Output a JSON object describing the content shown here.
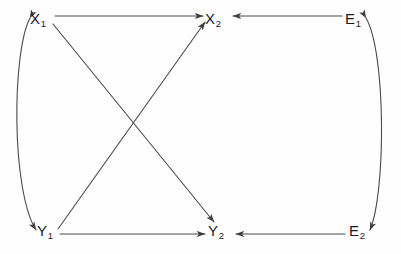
{
  "diagram": {
    "type": "path-diagram",
    "title": "",
    "background_color": "#fefefe",
    "line_color": "#4a4a4a",
    "text_color": "#1c1c1c",
    "nodes": [
      {
        "id": "X1",
        "base": "X",
        "sub": "1",
        "x": 38,
        "y": 19
      },
      {
        "id": "X2",
        "base": "X",
        "sub": "2",
        "x": 213,
        "y": 19
      },
      {
        "id": "E1",
        "base": "E",
        "sub": "1",
        "x": 353,
        "y": 19
      },
      {
        "id": "Y1",
        "base": "Y",
        "sub": "1",
        "x": 45,
        "y": 231
      },
      {
        "id": "Y2",
        "base": "Y",
        "sub": "2",
        "x": 216,
        "y": 231
      },
      {
        "id": "E2",
        "base": "E",
        "sub": "2",
        "x": 357,
        "y": 231
      }
    ],
    "edges": [
      {
        "id": "x1-to-x2",
        "from": "X1",
        "to": "X2",
        "style": "straight",
        "heads": "single"
      },
      {
        "id": "y1-to-y2",
        "from": "Y1",
        "to": "Y2",
        "style": "straight",
        "heads": "single"
      },
      {
        "id": "x1-to-y2",
        "from": "X1",
        "to": "Y2",
        "style": "straight",
        "heads": "single"
      },
      {
        "id": "y1-to-x2",
        "from": "Y1",
        "to": "X2",
        "style": "straight",
        "heads": "single"
      },
      {
        "id": "e1-to-x2",
        "from": "E1",
        "to": "X2",
        "style": "straight",
        "heads": "single"
      },
      {
        "id": "e2-to-y2",
        "from": "E2",
        "to": "Y2",
        "style": "straight",
        "heads": "single"
      },
      {
        "id": "x1-y1-covariance",
        "from": "X1",
        "to": "Y1",
        "style": "curved-left",
        "heads": "double"
      },
      {
        "id": "e1-e2-covariance",
        "from": "E1",
        "to": "E2",
        "style": "curved-right",
        "heads": "double"
      }
    ]
  }
}
